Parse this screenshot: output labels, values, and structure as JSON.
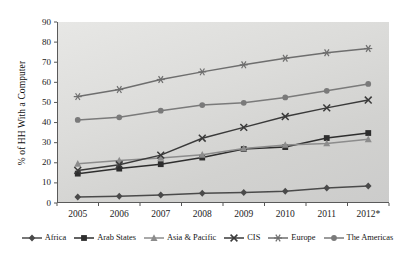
{
  "chart_data": {
    "type": "line",
    "title": "",
    "xlabel": "",
    "ylabel": "% of HH With a Computer",
    "categories": [
      "2005",
      "2006",
      "2007",
      "2008",
      "2009",
      "2010",
      "2011",
      "2012*"
    ],
    "ylim": [
      0,
      90
    ],
    "yticks": [
      0,
      10,
      20,
      30,
      40,
      50,
      60,
      70,
      80,
      90
    ],
    "grid": false,
    "legend_position": "bottom",
    "series": [
      {
        "name": "Africa",
        "marker": "diamond",
        "color": "#4a4a4a",
        "values": [
          3.0,
          3.4,
          4.0,
          4.8,
          5.2,
          5.9,
          7.4,
          8.4
        ]
      },
      {
        "name": "Arab States",
        "marker": "square",
        "color": "#2e2e2e",
        "values": [
          14.6,
          17.1,
          19.3,
          22.6,
          26.8,
          27.8,
          32.3,
          34.8
        ]
      },
      {
        "name": "Asia & Pacific",
        "marker": "triangle",
        "color": "#8c8c8c",
        "values": [
          19.5,
          21.1,
          22.4,
          24.0,
          27.1,
          28.9,
          29.6,
          31.7
        ]
      },
      {
        "name": "CIS",
        "marker": "cross",
        "color": "#3a3a3a",
        "values": [
          16.2,
          19.0,
          23.8,
          32.2,
          37.6,
          43.0,
          47.3,
          51.2
        ]
      },
      {
        "name": "Europe",
        "marker": "star",
        "color": "#6e6e6e",
        "values": [
          52.9,
          56.4,
          61.4,
          65.2,
          68.7,
          72.0,
          74.7,
          76.8
        ]
      },
      {
        "name": "The Americas",
        "marker": "circle",
        "color": "#7a7a7a",
        "values": [
          41.3,
          42.6,
          45.9,
          48.7,
          49.8,
          52.5,
          55.8,
          59.2
        ]
      }
    ]
  },
  "legend": {
    "items": [
      {
        "label": "Africa"
      },
      {
        "label": "Arab States"
      },
      {
        "label": "Asia & Pacific"
      },
      {
        "label": "CIS"
      },
      {
        "label": "Europe"
      },
      {
        "label": "The Americas"
      }
    ]
  }
}
